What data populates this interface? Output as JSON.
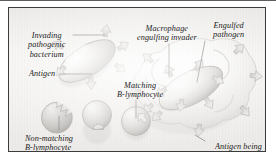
{
  "figure": {
    "kind": "biology-diagram",
    "style": "grayscale airbrush illustration, italic serif callout labels",
    "frame_color": "#3c3c3c",
    "panel_background": "#f2f1ef",
    "ink_color": "#1c1c1c"
  },
  "labels": {
    "invading_bacterium": "Invading\npathogenic\nbacterium",
    "invading_bacterium_lines": [
      "Invading",
      "pathogenic",
      "bacterium"
    ],
    "antigen": "Antigen",
    "macrophage": "Macrophage\nengulfing invader",
    "macrophage_lines": [
      "Macrophage",
      "engulfing invader"
    ],
    "engulfed_pathogen": "Engulfed\npathogen",
    "engulfed_pathogen_lines": [
      "Engulfed",
      "pathogen"
    ],
    "matching_lymphocyte": "Matching\nB-lymphocyte",
    "matching_lymphocyte_lines": [
      "Matching",
      "B-lymphocyte"
    ],
    "non_matching_lymphocyte": "Non-matching\nB-lymphocyte",
    "non_matching_lymphocyte_lines": [
      "Non-matching",
      "B-lymphocyte"
    ],
    "antigen_presented": "Antigen being\n\"presented\"",
    "antigen_presented_lines": [
      "Antigen being",
      "“presented”"
    ]
  },
  "elements": {
    "bacterium": {
      "name": "Invading pathogenic bacterium",
      "shape": "ellipse",
      "rotation_deg": -32,
      "antigen_count": 6
    },
    "macrophage": {
      "name": "Macrophage engulfing invader",
      "shape": "amoeboid blob with pseudopods",
      "antigen_count": 9
    },
    "engulfed_pathogen": {
      "name": "Engulfed pathogen",
      "shape": "ellipse",
      "rotation_deg": -28
    },
    "non_matching_lymphocyte": {
      "name": "Non-matching B-lymphocyte",
      "shape": "circle with jagged zigzag receptor notch"
    },
    "non_matching_lymphocyte_2": {
      "name": "Non-matching B-lymphocyte",
      "shape": "circle with rounded U receptor notch"
    },
    "matching_lymphocyte": {
      "name": "Matching B-lymphocyte",
      "shape": "circle with arrow-shaped receptor notch docking antigen"
    }
  },
  "colors": {
    "ink": "#1c1c1c",
    "cell_light": "#fbfbfa",
    "cell_mid": "#c9c7c4",
    "cell_dark": "#8d8a87",
    "antigen_fill": "#d7d5d2",
    "antigen_stroke": "#8a8784",
    "leader_line": "#33312f"
  }
}
